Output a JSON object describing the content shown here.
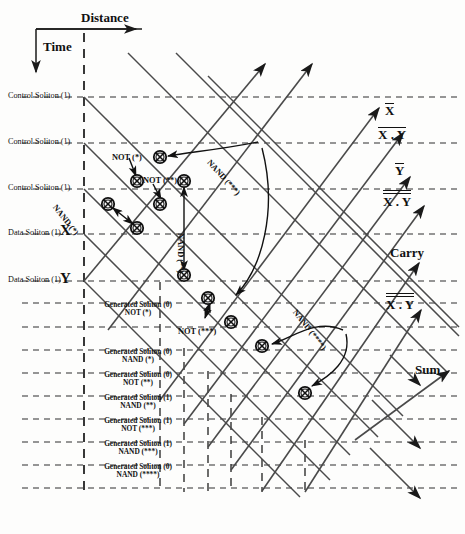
{
  "figure": {
    "kind": "soliton-collision-space-time-diagram",
    "axes": {
      "x_label": "Distance",
      "y_label": "Time"
    }
  },
  "left_axis_labels": [
    {
      "text": "Control Soliton (1)",
      "y": 97
    },
    {
      "text": "Control Soliton (1)",
      "y": 143
    },
    {
      "text": "Control Soliton (1)",
      "y": 189
    },
    {
      "text": "Data Soliton (1)",
      "y": 234
    },
    {
      "text": "Data Soliton (1)",
      "y": 281
    }
  ],
  "input_markers": [
    {
      "text": "X",
      "x": 60,
      "y": 222
    },
    {
      "text": "Y",
      "x": 60,
      "y": 270
    }
  ],
  "generated_solitons": [
    {
      "line1": "Generated Soliton (0)",
      "line2": "NOT (*)",
      "y": 303
    },
    {
      "line1": "Generated Soliton (0)",
      "line2": "NAND (*)",
      "y": 350
    },
    {
      "line1": "Generated Soliton (0)",
      "line2": "NOT (**)",
      "y": 373
    },
    {
      "line1": "Generated Soliton (1)",
      "line2": "NAND (**)",
      "y": 396
    },
    {
      "line1": "Generated Soliton (1)",
      "line2": "NOT (***)",
      "y": 419
    },
    {
      "line1": "Generated Soliton (1)",
      "line2": "NAND (***)",
      "y": 442
    },
    {
      "line1": "Generated Soliton (0)",
      "line2": "NAND (****)",
      "y": 465
    }
  ],
  "operation_annotations": [
    {
      "text": "NOT (*)",
      "x": 112,
      "y": 153,
      "rotation": 0
    },
    {
      "text": "NOT (**)",
      "x": 143,
      "y": 176,
      "rotation": 0
    },
    {
      "text": "NAND (*)",
      "x": 58,
      "y": 203,
      "rotation": 52
    },
    {
      "text": "NAND (**)",
      "x": 185,
      "y": 233,
      "rotation": 90
    },
    {
      "text": "NAND (***)",
      "x": 212,
      "y": 158,
      "rotation": 48
    },
    {
      "text": "NOT (***)",
      "x": 178,
      "y": 327,
      "rotation": 0
    },
    {
      "text": "NAND (****)",
      "x": 298,
      "y": 308,
      "rotation": 52
    }
  ],
  "output_labels": [
    {
      "id": "x-bar",
      "base": "X",
      "style": "overline-single",
      "x": 385,
      "y": 103
    },
    {
      "id": "x-bar-dot-y-bar",
      "base": "X . Y",
      "style": "overline-group",
      "x": 378,
      "y": 127
    },
    {
      "id": "y-bar",
      "base": "Y",
      "style": "overline-single",
      "x": 395,
      "y": 163
    },
    {
      "id": "x-dbl-dot-y",
      "base": "X . Y",
      "style": "overline-double",
      "x": 383,
      "y": 190
    },
    {
      "id": "carry",
      "base": "Carry",
      "style": "plain",
      "x": 390,
      "y": 245
    },
    {
      "id": "x-dot-y-dbl",
      "base": "X . Y",
      "style": "overline-double",
      "x": 386,
      "y": 293
    },
    {
      "id": "sum",
      "base": "Sum",
      "style": "plain",
      "x": 415,
      "y": 362
    }
  ],
  "collision_nodes": [
    {
      "id": "c1",
      "x": 160,
      "y": 157
    },
    {
      "id": "c2",
      "x": 137,
      "y": 181
    },
    {
      "id": "c3",
      "x": 184,
      "y": 181
    },
    {
      "id": "c4",
      "x": 108,
      "y": 204
    },
    {
      "id": "c5",
      "x": 160,
      "y": 204
    },
    {
      "id": "c6",
      "x": 137,
      "y": 228
    },
    {
      "id": "c7",
      "x": 184,
      "y": 275
    },
    {
      "id": "c8",
      "x": 208,
      "y": 298
    },
    {
      "id": "c9",
      "x": 231,
      "y": 322
    },
    {
      "id": "c10",
      "x": 262,
      "y": 346
    },
    {
      "id": "c11",
      "x": 305,
      "y": 393
    }
  ],
  "horizontal_guides": [
    97,
    143,
    189,
    234,
    281,
    303,
    327,
    350,
    373,
    396,
    419,
    442,
    465,
    488
  ],
  "vertical_guides": [
    83,
    160,
    184,
    208,
    231,
    262,
    305
  ],
  "colors": {
    "ink": "#111111",
    "line": "#444444",
    "dash": "#333333",
    "paper": "#fdfdfc"
  }
}
